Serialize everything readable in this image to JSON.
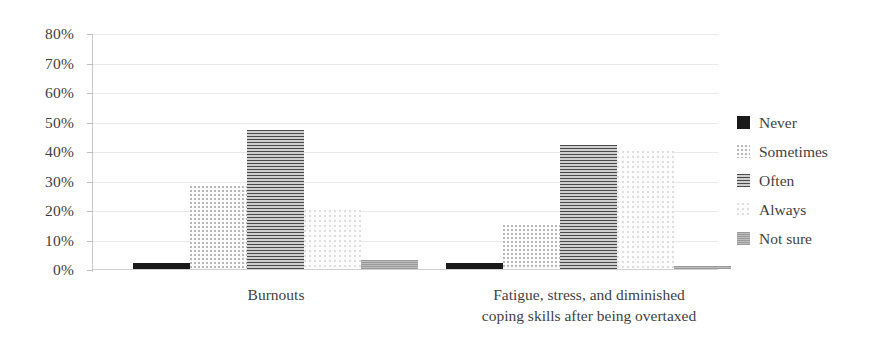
{
  "chart_data": {
    "type": "bar",
    "title": "",
    "xlabel": "",
    "ylabel": "",
    "ylim": [
      0,
      80
    ],
    "grid": true,
    "legend_position": "right",
    "categories": [
      "Burnouts",
      "Fatigue, stress, and diminished\ncoping skills after being overtaxed"
    ],
    "ytick_labels": [
      "80%",
      "70%",
      "60%",
      "50%",
      "40%",
      "30%",
      "20%",
      "10%",
      "0%"
    ],
    "ytick_values": [
      80,
      70,
      60,
      50,
      40,
      30,
      20,
      10,
      0
    ],
    "series": [
      {
        "name": "Never",
        "values": [
          2,
          2
        ],
        "color": "#1a1a1a",
        "pattern": "solid"
      },
      {
        "name": "Sometimes",
        "values": [
          28,
          15
        ],
        "color": "#d6d6d6",
        "pattern": "fine-dots"
      },
      {
        "name": "Often",
        "values": [
          47,
          42
        ],
        "color": "#6e6e6e",
        "pattern": "horizontal-hatch"
      },
      {
        "name": "Always",
        "values": [
          20,
          40
        ],
        "color": "#efefef",
        "pattern": "sparse-dots"
      },
      {
        "name": "Not sure",
        "values": [
          3,
          1
        ],
        "color": "#a8a8a8",
        "pattern": "dense-hatch"
      }
    ]
  },
  "legend": {
    "items": [
      {
        "label": "Never"
      },
      {
        "label": "Sometimes"
      },
      {
        "label": "Often"
      },
      {
        "label": "Always"
      },
      {
        "label": "Not sure"
      }
    ]
  },
  "axes": {
    "y_labels": [
      "80%",
      "70%",
      "60%",
      "50%",
      "40%",
      "30%",
      "20%",
      "10%",
      "0%"
    ],
    "x_labels": [
      "Burnouts",
      "Fatigue, stress, and diminished\ncoping skills after being overtaxed"
    ]
  }
}
